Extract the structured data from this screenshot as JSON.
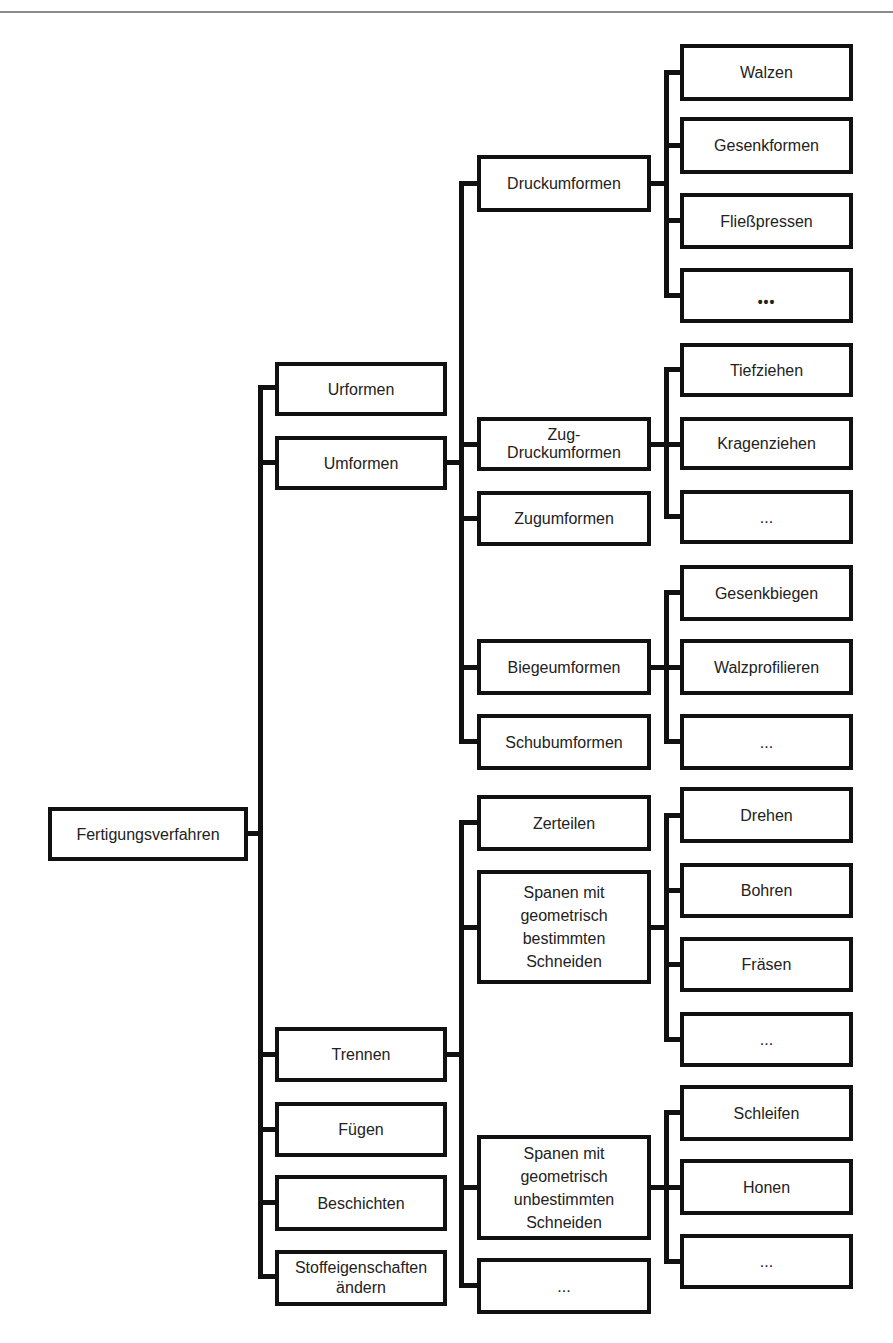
{
  "diagram": {
    "root": "Fertigungsverfahren",
    "level1": {
      "urformen": "Urformen",
      "umformen": "Umformen",
      "trennen": "Trennen",
      "fuegen": "Fügen",
      "beschichten": "Beschichten",
      "stoff": "Stoffeigenschaften\nändern"
    },
    "umformen_children": {
      "druck": "Druckumformen",
      "zugdruck": "Zug-\nDruckumformen",
      "zug": "Zugumformen",
      "biege": "Biegeumformen",
      "schub": "Schubumformen"
    },
    "druck_children": [
      "Walzen",
      "Gesenkformen",
      "Fließpressen",
      "•••"
    ],
    "zugdruck_children": [
      "Tiefziehen",
      "Kragenziehen",
      "..."
    ],
    "biege_children": [
      "Gesenkbiegen",
      "Walzprofilieren",
      "..."
    ],
    "trennen_children": {
      "zerteilen": "Zerteilen",
      "spanen_best": "Spanen mit\ngeometrisch\nbestimmten\nSchneiden",
      "spanen_unbest": "Spanen mit\ngeometrisch\nunbestimmten\nSchneiden",
      "more": "..."
    },
    "spanen_best_children": [
      "Drehen",
      "Bohren",
      "Fräsen",
      "..."
    ],
    "spanen_unbest_children": [
      "Schleifen",
      "Honen",
      "..."
    ]
  }
}
